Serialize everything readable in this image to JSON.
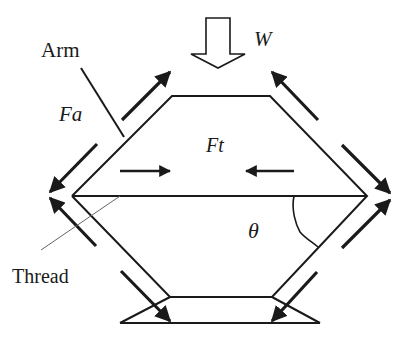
{
  "diagram": {
    "type": "force diagram",
    "colors": {
      "stroke": "#1a1a1a",
      "thread": "#555555",
      "background": "#ffffff"
    },
    "labels": {
      "arm": "Arm",
      "fa": "Fa",
      "w": "W",
      "ft": "Ft",
      "theta": "θ",
      "thread": "Thread"
    },
    "elements": [
      {
        "id": "load-arrow",
        "label": "W",
        "kind": "hollow arrow pointing down"
      },
      {
        "id": "arm-hexagon",
        "label": "Arm",
        "kind": "hexagonal frame of arms"
      },
      {
        "id": "thread-line",
        "label": "Thread",
        "kind": "horizontal line across hexagon"
      },
      {
        "id": "axial-force-arrows",
        "label": "Fa",
        "kind": "force arrows along arms"
      },
      {
        "id": "tension-arrows",
        "label": "Ft",
        "kind": "opposing horizontal arrows"
      },
      {
        "id": "angle-theta",
        "label": "θ",
        "kind": "angle arc between thread and arm"
      },
      {
        "id": "base",
        "kind": "trapezoid base"
      }
    ]
  }
}
